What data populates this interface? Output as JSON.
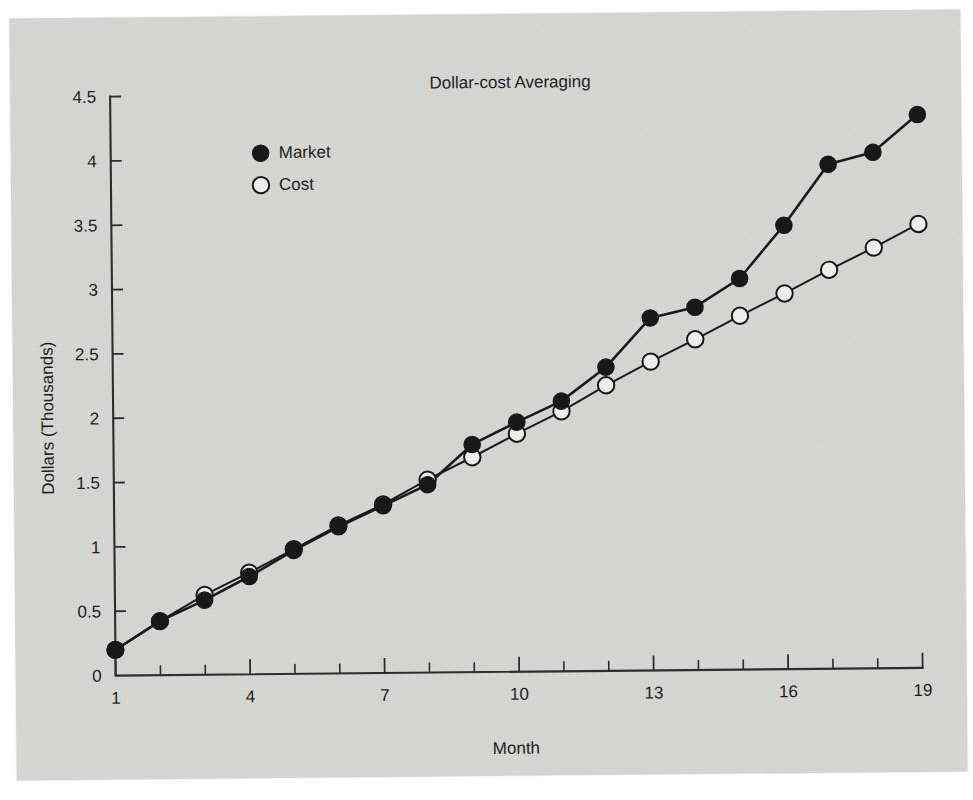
{
  "chart_data": {
    "type": "line",
    "title": "Dollar-cost Averaging",
    "xlabel": "Month",
    "ylabel": "Dollars (Thousands)",
    "x": [
      1,
      2,
      3,
      4,
      5,
      6,
      7,
      8,
      9,
      10,
      11,
      12,
      13,
      14,
      15,
      16,
      17,
      18,
      19
    ],
    "xlim": [
      1,
      19
    ],
    "ylim": [
      0,
      4.5
    ],
    "xticks": [
      1,
      2,
      3,
      4,
      5,
      6,
      7,
      8,
      9,
      10,
      11,
      12,
      13,
      14,
      15,
      16,
      17,
      18,
      19
    ],
    "xtick_labels_shown": [
      "1",
      "4",
      "7",
      "10",
      "13",
      "16",
      "19"
    ],
    "yticks": [
      0,
      0.5,
      1,
      1.5,
      2,
      2.5,
      3,
      3.5,
      4,
      4.5
    ],
    "ytick_labels": [
      "0",
      "0.5",
      "1",
      "1.5",
      "2",
      "2.5",
      "3",
      "3.5",
      "4",
      "4.5"
    ],
    "grid": false,
    "legend_position": "upper left",
    "series": [
      {
        "name": "Market",
        "marker": "filled-circle",
        "values": [
          0.2,
          0.42,
          0.58,
          0.76,
          0.96,
          1.14,
          1.3,
          1.46,
          1.77,
          1.94,
          2.1,
          2.36,
          2.74,
          2.82,
          3.04,
          3.45,
          3.92,
          4.01,
          4.3
        ]
      },
      {
        "name": "Cost",
        "marker": "open-circle",
        "values": [
          0.2,
          0.42,
          0.62,
          0.79,
          0.97,
          1.15,
          1.31,
          1.5,
          1.67,
          1.85,
          2.02,
          2.22,
          2.4,
          2.57,
          2.75,
          2.92,
          3.1,
          3.27,
          3.45
        ]
      }
    ]
  },
  "legend": {
    "entries": [
      {
        "label": "Market",
        "marker": "filled-circle"
      },
      {
        "label": "Cost",
        "marker": "open-circle"
      }
    ]
  },
  "colors": {
    "paper": "#d8d8d6",
    "ink": "#171717",
    "marker_market_fill": "#141414",
    "marker_cost_fill": "#f2f2f0"
  }
}
